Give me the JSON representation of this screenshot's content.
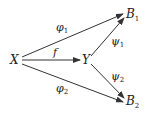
{
  "diagram": {
    "nodes": {
      "X": {
        "label": "X"
      },
      "Y": {
        "label": "Y"
      },
      "B1": {
        "label": "B",
        "sub": "1"
      },
      "B2": {
        "label": "B",
        "sub": "2"
      }
    },
    "edges": {
      "f": {
        "from": "X",
        "to": "Y",
        "label": "f"
      },
      "phi1": {
        "from": "X",
        "to": "B1",
        "label": "φ",
        "sub": "1"
      },
      "phi2": {
        "from": "X",
        "to": "B2",
        "label": "φ",
        "sub": "2"
      },
      "psi1": {
        "from": "Y",
        "to": "B1",
        "label": "ψ",
        "sub": "1"
      },
      "psi2": {
        "from": "Y",
        "to": "B2",
        "label": "ψ",
        "sub": "2"
      }
    },
    "line_color": "#333333"
  }
}
